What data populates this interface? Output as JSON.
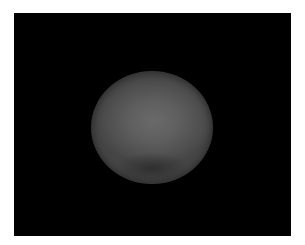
{
  "image": {
    "background_color": "#ffffff",
    "frame_color": "#000000",
    "subject": "gray sphere",
    "sphere_colors": {
      "highlight": "#6a6a6a",
      "mid": "#5a5a5a",
      "edge": "#454545",
      "shadow": "#1e1e1e"
    }
  }
}
